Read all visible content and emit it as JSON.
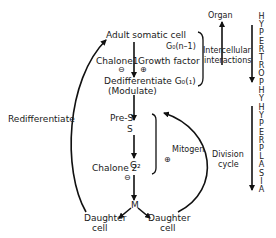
{
  "diagram": {
    "nodes": {
      "adult_somatic_cell": "Adult somatic cell",
      "go_n1": "G₀(n–1)",
      "chalone1": "Chalone1",
      "growth_factor": "Growth factor",
      "minus1": "⊖",
      "plus1": "⊕",
      "dedifferentiate": "Dedifferentiate G₀(₁)",
      "modulate": "(Modulate)",
      "pre_s": "Pre-S",
      "s": "S",
      "g2": "G₂",
      "chalone2": "Chalone 2",
      "minus2": "⊖",
      "m": "M",
      "daughter_left_1": "Daughter",
      "daughter_left_2": "cell",
      "daughter_right_1": "Daughter",
      "daughter_right_2": "cell",
      "mitogen": "Mitogen",
      "plus2": "⊕",
      "division_cycle_1": "Division",
      "division_cycle_2": "cycle",
      "organ": "Organ",
      "intercellular_1": "Intercellular",
      "intercellular_2": "interactions",
      "redifferentiate": "Redifferentiate",
      "hypertrophy": "H\nY\nP\nE\nR\nT\nR\nO\nP\nH\nY",
      "hyperplasia": "H\nY\nP\nE\nR\nP\nL\nA\nS\nI\nA"
    }
  }
}
